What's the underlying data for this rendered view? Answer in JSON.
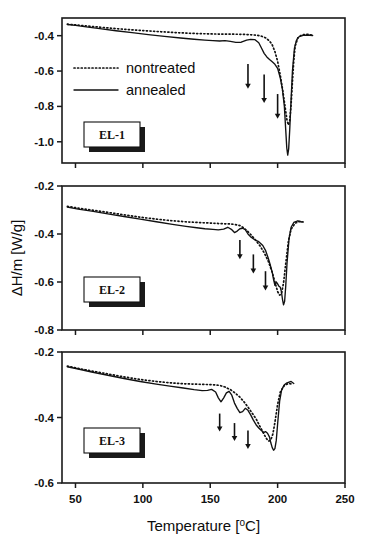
{
  "figure": {
    "width": 369,
    "height": 547
  },
  "axis": {
    "x_title": "Temperature [",
    "x_title_sup": "o",
    "x_title_tail": "C]",
    "x_title_full": "Temperature [oC]",
    "y_title_delta": "ΔH/m [W/g]",
    "x_ticks": [
      "50",
      "100",
      "150",
      "200",
      "250"
    ],
    "x_tick_values": [
      50,
      100,
      150,
      200,
      250
    ],
    "x_range": [
      40,
      250
    ]
  },
  "legend": {
    "entries": [
      {
        "label": "nontreated",
        "style": "dotted"
      },
      {
        "label": "annealed",
        "style": "solid"
      }
    ]
  },
  "panels": [
    {
      "id": "panel-el-1",
      "label": "EL-1"
    },
    {
      "id": "panel-el-2",
      "label": "EL-2"
    },
    {
      "id": "panel-el-3",
      "label": "EL-3"
    }
  ],
  "chart_data": [
    {
      "type": "line",
      "title": "EL-1",
      "xlabel": "Temperature [oC]",
      "ylabel": "ΔH/m [W/g]",
      "xlim": [
        40,
        250
      ],
      "ylim": [
        -1.12,
        -0.3
      ],
      "yticks": [
        -0.4,
        -0.6,
        -0.8,
        -1.0
      ],
      "ytick_labels": [
        "-0.4",
        "-0.6",
        "-0.8",
        "-1.0"
      ],
      "xticks": [
        50,
        100,
        150,
        200,
        250
      ],
      "grid": false,
      "legend_position": "upper-left",
      "annotations": [
        {
          "type": "arrow",
          "x": 178,
          "y_top": -0.56,
          "y_bottom": -0.7
        },
        {
          "type": "arrow",
          "x": 190,
          "y_top": -0.62,
          "y_bottom": -0.78
        },
        {
          "type": "arrow",
          "x": 200,
          "y_top": -0.73,
          "y_bottom": -0.87
        }
      ],
      "series": [
        {
          "name": "nontreated",
          "style": "dotted",
          "x": [
            44,
            50,
            58,
            68,
            80,
            92,
            104,
            116,
            128,
            140,
            150,
            158,
            164,
            170,
            176,
            181,
            185,
            188,
            191,
            194,
            196,
            198,
            200,
            202,
            204,
            205.5,
            207,
            208,
            209,
            210,
            211,
            212,
            213,
            215,
            218,
            222,
            226
          ],
          "y": [
            -0.335,
            -0.339,
            -0.345,
            -0.352,
            -0.36,
            -0.367,
            -0.373,
            -0.379,
            -0.384,
            -0.388,
            -0.39,
            -0.391,
            -0.391,
            -0.392,
            -0.393,
            -0.395,
            -0.398,
            -0.403,
            -0.412,
            -0.43,
            -0.452,
            -0.49,
            -0.545,
            -0.625,
            -0.72,
            -0.8,
            -0.88,
            -0.905,
            -0.88,
            -0.79,
            -0.66,
            -0.54,
            -0.46,
            -0.412,
            -0.395,
            -0.392,
            -0.398
          ]
        },
        {
          "name": "annealed",
          "style": "solid",
          "x": [
            44,
            50,
            58,
            68,
            80,
            92,
            104,
            116,
            128,
            138,
            146,
            152,
            157,
            161,
            165,
            169,
            173,
            177,
            180,
            183,
            186,
            188,
            190,
            192,
            194,
            196,
            198,
            200,
            202,
            203.5,
            205,
            206,
            206.8,
            207.5,
            208.2,
            209,
            210,
            211,
            212.5,
            214,
            216,
            219,
            222,
            226
          ],
          "y": [
            -0.337,
            -0.342,
            -0.35,
            -0.36,
            -0.372,
            -0.383,
            -0.394,
            -0.404,
            -0.413,
            -0.42,
            -0.425,
            -0.428,
            -0.43,
            -0.428,
            -0.432,
            -0.438,
            -0.437,
            -0.425,
            -0.421,
            -0.422,
            -0.44,
            -0.47,
            -0.5,
            -0.52,
            -0.535,
            -0.548,
            -0.562,
            -0.585,
            -0.64,
            -0.7,
            -0.8,
            -0.93,
            -1.035,
            -1.075,
            -1.04,
            -0.93,
            -0.76,
            -0.6,
            -0.47,
            -0.425,
            -0.405,
            -0.398,
            -0.396,
            -0.399
          ]
        }
      ]
    },
    {
      "type": "line",
      "title": "EL-2",
      "xlabel": "Temperature [oC]",
      "ylabel": "ΔH/m [W/g]",
      "xlim": [
        40,
        250
      ],
      "ylim": [
        -0.8,
        -0.2
      ],
      "yticks": [
        -0.2,
        -0.4,
        -0.6,
        -0.8
      ],
      "ytick_labels": [
        "-0.2",
        "-0.4",
        "-0.6",
        "-0.8"
      ],
      "xticks": [
        50,
        100,
        150,
        200,
        250
      ],
      "grid": false,
      "legend_position": "none",
      "annotations": [
        {
          "type": "arrow",
          "x": 172,
          "y_top": -0.425,
          "y_bottom": -0.505
        },
        {
          "type": "arrow",
          "x": 182,
          "y_top": -0.485,
          "y_bottom": -0.565
        },
        {
          "type": "arrow",
          "x": 191,
          "y_top": -0.555,
          "y_bottom": -0.635
        }
      ],
      "series": [
        {
          "name": "nontreated",
          "style": "dotted",
          "x": [
            44,
            52,
            62,
            74,
            86,
            98,
            110,
            122,
            134,
            144,
            152,
            158,
            164,
            168,
            172,
            175,
            178,
            181,
            184,
            187,
            190,
            193,
            196,
            198,
            200,
            201.5,
            203,
            204.5,
            206,
            208,
            210,
            213,
            216,
            219
          ],
          "y": [
            -0.285,
            -0.292,
            -0.3,
            -0.31,
            -0.32,
            -0.33,
            -0.338,
            -0.345,
            -0.35,
            -0.353,
            -0.355,
            -0.357,
            -0.358,
            -0.36,
            -0.365,
            -0.375,
            -0.39,
            -0.408,
            -0.428,
            -0.45,
            -0.478,
            -0.512,
            -0.56,
            -0.6,
            -0.64,
            -0.655,
            -0.645,
            -0.6,
            -0.525,
            -0.43,
            -0.38,
            -0.355,
            -0.348,
            -0.35
          ]
        },
        {
          "name": "annealed",
          "style": "solid",
          "x": [
            44,
            52,
            62,
            74,
            86,
            98,
            110,
            122,
            132,
            140,
            146,
            152,
            156,
            160,
            163,
            166,
            168,
            170,
            172,
            174,
            176,
            178,
            180,
            183,
            186,
            189,
            191,
            193,
            194.5,
            196,
            197,
            198,
            199,
            200,
            201,
            202,
            202.8,
            203.6,
            204.4,
            205.2,
            206,
            207,
            208.5,
            210,
            212,
            215,
            218
          ],
          "y": [
            -0.288,
            -0.296,
            -0.305,
            -0.316,
            -0.327,
            -0.338,
            -0.349,
            -0.36,
            -0.368,
            -0.374,
            -0.378,
            -0.381,
            -0.383,
            -0.38,
            -0.372,
            -0.382,
            -0.394,
            -0.388,
            -0.378,
            -0.376,
            -0.382,
            -0.4,
            -0.412,
            -0.424,
            -0.432,
            -0.448,
            -0.468,
            -0.5,
            -0.528,
            -0.56,
            -0.59,
            -0.614,
            -0.6,
            -0.608,
            -0.618,
            -0.622,
            -0.64,
            -0.672,
            -0.695,
            -0.68,
            -0.62,
            -0.52,
            -0.418,
            -0.372,
            -0.352,
            -0.345,
            -0.35
          ]
        }
      ]
    },
    {
      "type": "line",
      "title": "EL-3",
      "xlabel": "Temperature [oC]",
      "ylabel": "ΔH/m [W/g]",
      "xlim": [
        40,
        250
      ],
      "ylim": [
        -0.6,
        -0.2
      ],
      "yticks": [
        -0.2,
        -0.4,
        -0.6
      ],
      "ytick_labels": [
        "-0.2",
        "-0.4",
        "-0.6"
      ],
      "xticks": [
        50,
        100,
        150,
        200,
        250
      ],
      "grid": false,
      "legend_position": "none",
      "annotations": [
        {
          "type": "arrow",
          "x": 157,
          "y_top": -0.388,
          "y_bottom": -0.443
        },
        {
          "type": "arrow",
          "x": 168,
          "y_top": -0.417,
          "y_bottom": -0.472
        },
        {
          "type": "arrow",
          "x": 178,
          "y_top": -0.44,
          "y_bottom": -0.496
        }
      ],
      "series": [
        {
          "name": "nontreated",
          "style": "dotted",
          "x": [
            44,
            52,
            62,
            74,
            86,
            98,
            110,
            120,
            130,
            138,
            146,
            152,
            157,
            161,
            165,
            169,
            172,
            175,
            178,
            181,
            184,
            186,
            188,
            190,
            192,
            193.5,
            195,
            196.5,
            198,
            200,
            202,
            205,
            208,
            211
          ],
          "y": [
            -0.243,
            -0.25,
            -0.258,
            -0.267,
            -0.276,
            -0.284,
            -0.29,
            -0.294,
            -0.297,
            -0.298,
            -0.299,
            -0.3,
            -0.302,
            -0.307,
            -0.315,
            -0.327,
            -0.338,
            -0.352,
            -0.368,
            -0.386,
            -0.404,
            -0.42,
            -0.436,
            -0.452,
            -0.466,
            -0.472,
            -0.468,
            -0.45,
            -0.415,
            -0.36,
            -0.322,
            -0.302,
            -0.296,
            -0.298
          ]
        },
        {
          "name": "annealed",
          "style": "solid",
          "x": [
            44,
            52,
            62,
            74,
            86,
            98,
            110,
            120,
            130,
            138,
            144,
            148,
            151,
            154,
            156,
            158,
            160,
            162,
            164,
            166,
            168,
            170,
            172,
            174,
            176,
            178,
            180,
            182,
            184,
            186,
            188,
            189.5,
            191,
            192.5,
            194,
            195,
            196,
            197,
            198,
            199,
            200,
            201.5,
            203,
            205,
            207,
            210,
            212
          ],
          "y": [
            -0.245,
            -0.252,
            -0.261,
            -0.271,
            -0.281,
            -0.29,
            -0.298,
            -0.304,
            -0.31,
            -0.315,
            -0.318,
            -0.317,
            -0.314,
            -0.322,
            -0.34,
            -0.352,
            -0.34,
            -0.325,
            -0.32,
            -0.332,
            -0.356,
            -0.372,
            -0.385,
            -0.382,
            -0.372,
            -0.378,
            -0.392,
            -0.408,
            -0.422,
            -0.432,
            -0.44,
            -0.446,
            -0.443,
            -0.448,
            -0.46,
            -0.478,
            -0.492,
            -0.5,
            -0.495,
            -0.47,
            -0.42,
            -0.35,
            -0.315,
            -0.3,
            -0.294,
            -0.29,
            -0.296
          ]
        }
      ]
    }
  ]
}
